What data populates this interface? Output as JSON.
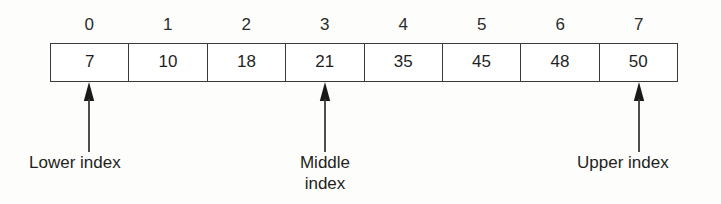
{
  "figure": {
    "type": "binary-search-array-diagram",
    "background_color": "#fdfdfc",
    "line_color": "#3a3a3a",
    "text_color": "#231f20"
  },
  "array": {
    "indices": [
      "0",
      "1",
      "2",
      "3",
      "4",
      "5",
      "6",
      "7"
    ],
    "values": [
      "7",
      "10",
      "18",
      "21",
      "35",
      "45",
      "48",
      "50"
    ]
  },
  "pointers": [
    {
      "name": "lower-index",
      "label": "Lower index",
      "target_index": "0",
      "arrow": "arrow-up-icon"
    },
    {
      "name": "middle-index",
      "label": "Middle\nindex",
      "target_index": "3",
      "arrow": "arrow-up-icon"
    },
    {
      "name": "upper-index",
      "label": "Upper index",
      "target_index": "7",
      "arrow": "arrow-up-icon"
    }
  ]
}
